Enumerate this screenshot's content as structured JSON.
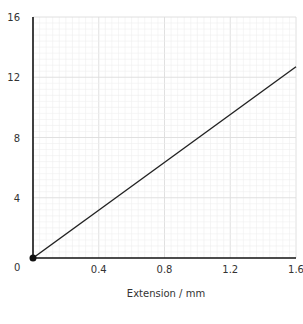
{
  "chart_data": {
    "type": "line",
    "title": "",
    "xlabel": "Extension / mm",
    "ylabel": "",
    "xlim": [
      0,
      1.6
    ],
    "ylim": [
      0,
      16
    ],
    "x_ticks": [
      "0.4",
      "0.8",
      "1.2",
      "1.6"
    ],
    "y_ticks": [
      "4",
      "8",
      "12",
      "16"
    ],
    "origin_label": "0",
    "grid": true,
    "series": [
      {
        "name": "extension",
        "x": [
          0,
          1.6
        ],
        "y": [
          0,
          12.7
        ]
      }
    ],
    "annotations": [
      "origin point marker"
    ]
  },
  "colors": {
    "line": "#222222",
    "axis": "#111111",
    "grid_major": "#dcdcdc",
    "grid_minor": "#efefef"
  }
}
